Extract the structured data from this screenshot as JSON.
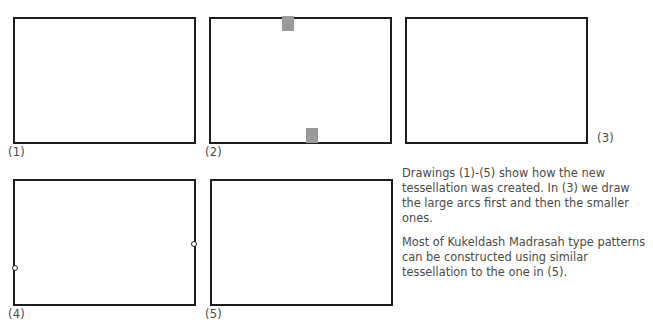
{
  "page": {
    "background_color": "#ffffff",
    "ink_color": "#3a3a3a",
    "cropped_top_text": "",
    "width": 653,
    "height": 333
  },
  "figures": {
    "panel1": {
      "caption": "(1)",
      "frame": {
        "x": 14,
        "y": 18,
        "w": 181,
        "h": 125
      },
      "description": "rectangle with straight line pencils radiating from the bottom-left and top-right corners",
      "fan_bottom_left": [
        [
          14,
          143,
          107,
          18
        ],
        [
          14,
          143,
          150,
          18
        ],
        [
          14,
          143,
          195,
          18
        ],
        [
          14,
          143,
          195,
          62
        ],
        [
          14,
          143,
          195,
          100
        ]
      ],
      "fan_top_right": [
        [
          195,
          18,
          14,
          143
        ],
        [
          195,
          18,
          14,
          102
        ],
        [
          195,
          18,
          60,
          143
        ],
        [
          195,
          18,
          102,
          143
        ],
        [
          195,
          18,
          14,
          70
        ]
      ],
      "extra_lines": [
        [
          14,
          75,
          195,
          18
        ],
        [
          14,
          118,
          195,
          62
        ]
      ]
    },
    "panel2": {
      "caption": "(2)",
      "frame": {
        "x": 210,
        "y": 18,
        "w": 181,
        "h": 125
      },
      "description": "same pencil of lines with two large circular arcs added; two grey marker rectangles mark the arc intersection points",
      "markers": [
        {
          "x": 284,
          "y": 16,
          "w": 12,
          "h": 15,
          "color": "#9a9a9a"
        },
        {
          "x": 308,
          "y": 128,
          "w": 12,
          "h": 15,
          "color": "#9a9a9a"
        }
      ],
      "nodes": [
        [
          284,
          55
        ],
        [
          332,
          108
        ]
      ]
    },
    "panel3": {
      "caption": "(3)",
      "frame": {
        "x": 406,
        "y": 18,
        "w": 181,
        "h": 125
      },
      "description": "large arcs drawn first, then the smaller ones; full arc and line network",
      "nodes": [
        [
          479,
          55
        ],
        [
          528,
          108
        ],
        [
          554,
          60
        ],
        [
          440,
          105
        ]
      ]
    },
    "panel4": {
      "caption": "(4)",
      "frame": {
        "x": 14,
        "y": 180,
        "w": 181,
        "h": 125
      },
      "description": "complete construction with the resulting tessellation edges traced in bold",
      "node_dots": [
        [
          14,
          268
        ],
        [
          195,
          217
        ]
      ]
    },
    "panel5": {
      "caption": "(5)",
      "frame": {
        "x": 211,
        "y": 180,
        "w": 181,
        "h": 125
      },
      "description": "final clean tessellation of straight-edged tiles",
      "vertices": [
        [
          283,
          213
        ],
        [
          345,
          260
        ],
        [
          225,
          187
        ],
        [
          287,
          180
        ],
        [
          378,
          180
        ],
        [
          364,
          207
        ],
        [
          392,
          207
        ],
        [
          246,
          292
        ],
        [
          211,
          244
        ],
        [
          262,
          250
        ],
        [
          211,
          263
        ],
        [
          345,
          305
        ],
        [
          246,
          305
        ],
        [
          392,
          262
        ]
      ],
      "edges": [
        [
          [
            287,
            180
          ],
          [
            283,
            213
          ]
        ],
        [
          [
            283,
            213
          ],
          [
            225,
            187
          ]
        ],
        [
          [
            225,
            187
          ],
          [
            211,
            190
          ]
        ],
        [
          [
            283,
            213
          ],
          [
            262,
            250
          ]
        ],
        [
          [
            262,
            250
          ],
          [
            246,
            292
          ]
        ],
        [
          [
            246,
            292
          ],
          [
            246,
            305
          ]
        ],
        [
          [
            262,
            250
          ],
          [
            211,
            244
          ]
        ],
        [
          [
            283,
            213
          ],
          [
            345,
            260
          ]
        ],
        [
          [
            345,
            260
          ],
          [
            364,
            207
          ]
        ],
        [
          [
            364,
            207
          ],
          [
            378,
            180
          ]
        ],
        [
          [
            364,
            207
          ],
          [
            392,
            200
          ]
        ],
        [
          [
            345,
            260
          ],
          [
            345,
            305
          ]
        ],
        [
          [
            345,
            260
          ],
          [
            246,
            292
          ]
        ],
        [
          [
            345,
            260
          ],
          [
            392,
            268
          ]
        ]
      ]
    }
  },
  "caption_text": {
    "paragraph1": "Drawings (1)-(5) show how the new tessellation was created. In (3) we draw the large arcs first and then the smaller ones.",
    "paragraph2": "Most of Kukeldash Madrasah type patterns can be constructed using similar tessellation to the one in (5)."
  }
}
